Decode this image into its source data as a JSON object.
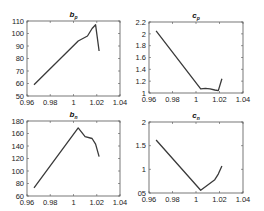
{
  "chart_data": [
    {
      "type": "line",
      "title": "b_p",
      "title_main": "b",
      "title_sub": "p",
      "xlabel": "",
      "ylabel": "",
      "xlim": [
        0.96,
        1.04
      ],
      "ylim": [
        50,
        110
      ],
      "xticks": [
        0.96,
        0.98,
        1,
        1.02,
        1.04
      ],
      "xtick_labels": [
        "0.96",
        "0.98",
        "1",
        "1.02",
        "1.04"
      ],
      "yticks": [
        50,
        60,
        70,
        80,
        90,
        100,
        110
      ],
      "ytick_labels": [
        "50",
        "60",
        "70",
        "80",
        "90",
        "100",
        "110"
      ],
      "x": [
        0.966,
        1.004,
        1.012,
        1.016,
        1.019,
        1.022
      ],
      "y": [
        59,
        94,
        98,
        104,
        107,
        86
      ],
      "box": [
        27,
        21,
        120,
        96
      ]
    },
    {
      "type": "line",
      "title": "c_p",
      "title_main": "c",
      "title_sub": "p",
      "xlabel": "",
      "ylabel": "",
      "xlim": [
        0.96,
        1.04
      ],
      "ylim": [
        1,
        2.2
      ],
      "xticks": [
        0.96,
        0.98,
        1,
        1.02,
        1.04
      ],
      "xtick_labels": [
        "0.96",
        "0.98",
        "1",
        "1.02",
        "1.04"
      ],
      "yticks": [
        1,
        1.2,
        1.4,
        1.6,
        1.8,
        2,
        2.2
      ],
      "ytick_labels": [
        "1",
        "1.2",
        "1.4",
        "1.6",
        "1.8",
        "2",
        "2.2"
      ],
      "x": [
        0.966,
        1.004,
        1.008,
        1.012,
        1.016,
        1.019,
        1.022
      ],
      "y": [
        2.05,
        1.07,
        1.08,
        1.07,
        1.05,
        1.04,
        1.24
      ],
      "box": [
        149,
        22,
        243,
        93
      ]
    },
    {
      "type": "line",
      "title": "b_n",
      "title_main": "b",
      "title_sub": "n",
      "xlabel": "",
      "ylabel": "",
      "xlim": [
        0.96,
        1.04
      ],
      "ylim": [
        60,
        180
      ],
      "xticks": [
        0.96,
        0.98,
        1,
        1.02,
        1.04
      ],
      "xtick_labels": [
        "0.96",
        "0.98",
        "1",
        "1.02",
        "1.04"
      ],
      "yticks": [
        60,
        80,
        100,
        120,
        140,
        160,
        180
      ],
      "ytick_labels": [
        "60",
        "80",
        "100",
        "120",
        "140",
        "160",
        "180"
      ],
      "x": [
        0.966,
        1.004,
        1.01,
        1.016,
        1.019,
        1.022
      ],
      "y": [
        73,
        169,
        155,
        152,
        143,
        123
      ],
      "box": [
        27,
        121,
        120,
        196
      ]
    },
    {
      "type": "line",
      "title": "c_n",
      "title_main": "c",
      "title_sub": "n",
      "xlabel": "",
      "ylabel": "",
      "xlim": [
        0.96,
        1.04
      ],
      "ylim": [
        0.5,
        2
      ],
      "xticks": [
        0.96,
        0.98,
        1,
        1.02,
        1.04
      ],
      "xtick_labels": [
        "0.96",
        "0.98",
        "1",
        "1.02",
        "1.04"
      ],
      "yticks": [
        0.5,
        1,
        1.5,
        2
      ],
      "ytick_labels": [
        "05",
        "1",
        "1.5",
        "2"
      ],
      "x": [
        0.966,
        1.004,
        1.016,
        1.019,
        1.022
      ],
      "y": [
        1.62,
        0.56,
        0.78,
        0.9,
        1.07
      ],
      "box": [
        149,
        122,
        243,
        193
      ]
    }
  ],
  "style": {
    "line_color": "#3a3a3a",
    "axis_color": "#555555",
    "background": "#ffffff"
  }
}
